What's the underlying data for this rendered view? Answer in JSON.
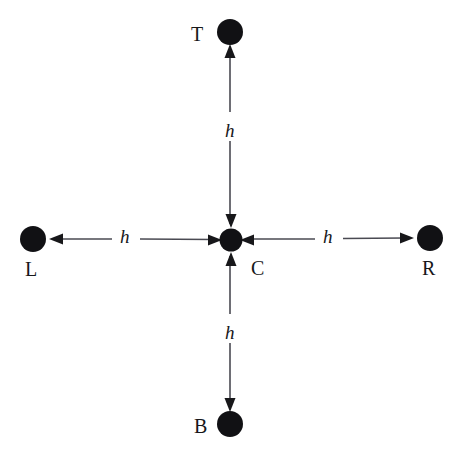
{
  "figure": {
    "type": "stencil-diagram",
    "width": 460,
    "height": 458,
    "background_color": "#ffffff",
    "ink_color": "#17171a",
    "line_color": "#4a4a52"
  },
  "nodes": [
    {
      "id": "T",
      "label": "T",
      "cx": 230,
      "cy": 32,
      "r": 13,
      "label_x": 191,
      "label_y": 24,
      "label_position": "left"
    },
    {
      "id": "L",
      "label": "L",
      "cx": 33,
      "cy": 239,
      "r": 13,
      "label_x": 25,
      "label_y": 259,
      "label_position": "below"
    },
    {
      "id": "C",
      "label": "C",
      "cx": 231,
      "cy": 240,
      "r": 11.5,
      "label_x": 251,
      "label_y": 258,
      "label_position": "below-right"
    },
    {
      "id": "R",
      "label": "R",
      "cx": 430,
      "cy": 238,
      "r": 13,
      "label_x": 422,
      "label_y": 258,
      "label_position": "below"
    },
    {
      "id": "B",
      "label": "B",
      "cx": 230,
      "cy": 424,
      "r": 13,
      "label_x": 194,
      "label_y": 416,
      "label_position": "left"
    }
  ],
  "arrows": [
    {
      "id": "arrow-top",
      "from": "C",
      "to": "T",
      "direction": "up",
      "label": "h",
      "label_x": 222,
      "label_y": 122
    },
    {
      "id": "arrow-left",
      "from": "C",
      "to": "L",
      "direction": "left",
      "label": "h",
      "label_x": 118,
      "label_y": 227
    },
    {
      "id": "arrow-right",
      "from": "C",
      "to": "R",
      "direction": "right",
      "label": "h",
      "label_x": 321,
      "label_y": 227
    },
    {
      "id": "arrow-bottom",
      "from": "C",
      "to": "B",
      "direction": "down",
      "label": "h",
      "label_x": 222,
      "label_y": 324
    }
  ],
  "spacing_symbol": "h",
  "labels": {
    "top": "T",
    "left": "L",
    "center": "C",
    "right": "R",
    "bottom": "B",
    "spacing_top": "h",
    "spacing_left": "h",
    "spacing_right": "h",
    "spacing_bottom": "h"
  }
}
